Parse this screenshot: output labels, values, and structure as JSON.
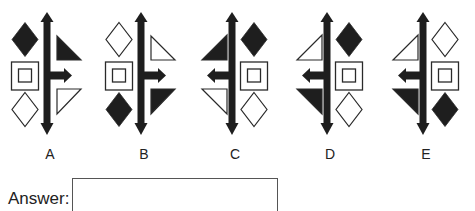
{
  "question": {
    "options": [
      {
        "label": "A",
        "center_x": 47,
        "left_side": "shapes",
        "right_side": "triangles",
        "arrow_direction": "right",
        "shapes": {
          "top": "filled-diamond",
          "middle": "square-in-square",
          "bottom": "hollow-diamond"
        },
        "triangles": {
          "top": "filled",
          "bottom": "hollow"
        }
      },
      {
        "label": "B",
        "center_x": 141,
        "left_side": "shapes",
        "right_side": "triangles",
        "arrow_direction": "right",
        "shapes": {
          "top": "hollow-diamond",
          "middle": "square-in-square",
          "bottom": "filled-diamond"
        },
        "triangles": {
          "top": "hollow",
          "bottom": "filled"
        }
      },
      {
        "label": "C",
        "center_x": 232,
        "left_side": "triangles",
        "right_side": "shapes",
        "arrow_direction": "left",
        "shapes": {
          "top": "filled-diamond",
          "middle": "square-in-square",
          "bottom": "hollow-diamond"
        },
        "triangles": {
          "top": "filled",
          "bottom": "hollow"
        }
      },
      {
        "label": "D",
        "center_x": 327,
        "left_side": "triangles",
        "right_side": "shapes",
        "arrow_direction": "left",
        "shapes": {
          "top": "filled-diamond",
          "middle": "square-in-square",
          "bottom": "hollow-diamond"
        },
        "triangles": {
          "top": "hollow",
          "bottom": "filled"
        }
      },
      {
        "label": "E",
        "center_x": 423,
        "left_side": "triangles",
        "right_side": "shapes",
        "arrow_direction": "left",
        "shapes": {
          "top": "hollow-diamond",
          "middle": "square-in-square",
          "bottom": "filled-diamond"
        },
        "triangles": {
          "top": "hollow",
          "bottom": "filled"
        }
      }
    ]
  },
  "answer": {
    "label": "Answer:",
    "value": ""
  },
  "colors": {
    "fill": "#1e1e1e",
    "stroke": "#2a2a2a",
    "background": "#ffffff"
  }
}
